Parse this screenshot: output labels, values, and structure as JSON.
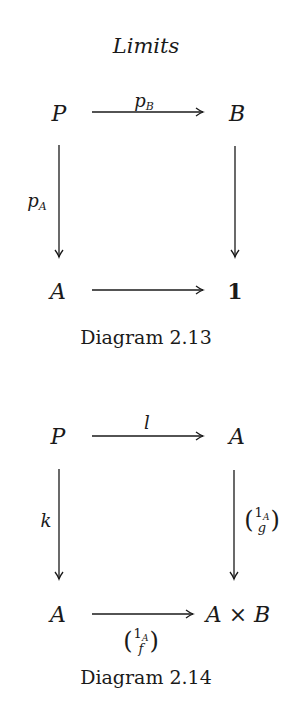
{
  "page_header": {
    "title": "Limits"
  },
  "diagram_2_13": {
    "caption": "Diagram 2.13",
    "nodes": {
      "top_left": "P",
      "top_right": "B",
      "bottom_left": "A",
      "bottom_right": "1"
    },
    "arrows": {
      "top": {
        "base": "p",
        "subscript": "B"
      },
      "left": {
        "base": "p",
        "subscript": "A"
      },
      "right": "",
      "bottom": ""
    }
  },
  "diagram_2_14": {
    "caption": "Diagram 2.14",
    "nodes": {
      "top_left": "P",
      "top_right": "A",
      "bottom_left": "A",
      "bottom_right": "A × B"
    },
    "arrows": {
      "top": "l",
      "left": "k",
      "right": {
        "open": "(",
        "top": "1",
        "top_sub": "A",
        "bottom": "g",
        "close": ")"
      },
      "bottom": {
        "open": "(",
        "top": "1",
        "top_sub": "A",
        "bottom": "f",
        "close": ")"
      }
    }
  }
}
